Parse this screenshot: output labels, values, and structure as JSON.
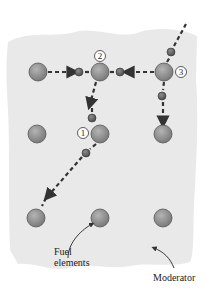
{
  "diagram": {
    "type": "nuclear-chain-reaction",
    "colors": {
      "moderator": "#e8e8e8",
      "fuel": "#8a8a8a",
      "neutron": "#5f5f5f",
      "path": "#333333"
    },
    "fuel_elements": [
      {
        "x": 38,
        "y": 72
      },
      {
        "x": 100,
        "y": 72
      },
      {
        "x": 164,
        "y": 72
      },
      {
        "x": 37,
        "y": 134
      },
      {
        "x": 100,
        "y": 134
      },
      {
        "x": 163,
        "y": 134
      },
      {
        "x": 36,
        "y": 218
      },
      {
        "x": 100,
        "y": 218
      },
      {
        "x": 163,
        "y": 218
      }
    ],
    "event_markers": [
      {
        "number": "1",
        "x": 83,
        "y": 133
      },
      {
        "number": "2",
        "x": 100,
        "y": 56
      },
      {
        "number": "3",
        "x": 181,
        "y": 72
      }
    ],
    "labels": {
      "fuel": "Fuel\nelements",
      "fuel_line1": "Fuel",
      "fuel_line2": "elements",
      "moderator": "Moderator"
    }
  }
}
